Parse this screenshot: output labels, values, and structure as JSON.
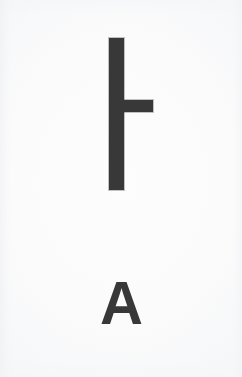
{
  "card": {
    "background_color": "#fbfbfc",
    "ink_color": "#383838",
    "width": 242,
    "height": 377,
    "media": "printed-card-scan"
  },
  "symbol": {
    "name": "turnstile-mark",
    "description": "vertical stroke with a horizontal arm extending to the right",
    "strokes": [
      {
        "name": "vertical-stroke",
        "orientation": "vertical",
        "x": 109,
        "y": 38,
        "width": 15,
        "height": 152,
        "color": "#383838"
      },
      {
        "name": "horizontal-arm",
        "orientation": "horizontal",
        "x": 122,
        "y": 100,
        "width": 31,
        "height": 12,
        "color": "#383838"
      }
    ]
  },
  "label": {
    "text": "A",
    "color": "#383838",
    "weight": "bold",
    "font_size_px": 62,
    "position": "below-symbol",
    "align": "center"
  }
}
